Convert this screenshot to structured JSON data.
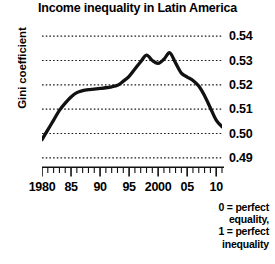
{
  "chart_data": {
    "type": "line",
    "title": "Income inequality in Latin America",
    "xlabel": "",
    "ylabel": "Gini coefficient",
    "ylim": [
      0.485,
      0.545
    ],
    "xlim": [
      1980,
      2011
    ],
    "grid": true,
    "legend": null,
    "ytick_labels": [
      "0.54",
      "0.53",
      "0.52",
      "0.51",
      "0.50",
      "0.49"
    ],
    "ytick_values": [
      0.54,
      0.53,
      0.52,
      0.51,
      0.5,
      0.49
    ],
    "xtick_labels": [
      "1980",
      "85",
      "90",
      "95",
      "2000",
      "05",
      "10"
    ],
    "xtick_values": [
      1980,
      1985,
      1990,
      1995,
      2000,
      2005,
      2010
    ],
    "minor_tick_interval": 1,
    "annotation": {
      "line1": "0 = perfect",
      "line2": "equality,",
      "line3": "1 = perfect",
      "line4": "inequality"
    },
    "series": [
      {
        "name": "Gini coefficient",
        "color": "#111111",
        "x": [
          1980,
          1981,
          1982,
          1983,
          1984,
          1985,
          1986,
          1987,
          1988,
          1989,
          1990,
          1991,
          1992,
          1993,
          1994,
          1995,
          1996,
          1997,
          1998,
          1999,
          2000,
          2001,
          2002,
          2003,
          2004,
          2005,
          2006,
          2007,
          2008,
          2009,
          2010,
          2011
        ],
        "values": [
          0.4975,
          0.5015,
          0.5055,
          0.5095,
          0.5125,
          0.515,
          0.5168,
          0.5176,
          0.518,
          0.5182,
          0.5185,
          0.5188,
          0.5192,
          0.5198,
          0.5215,
          0.5235,
          0.5265,
          0.5295,
          0.5322,
          0.53,
          0.5288,
          0.5305,
          0.5332,
          0.529,
          0.5248,
          0.5232,
          0.5218,
          0.5195,
          0.5155,
          0.5105,
          0.5055,
          0.5028
        ]
      }
    ]
  }
}
